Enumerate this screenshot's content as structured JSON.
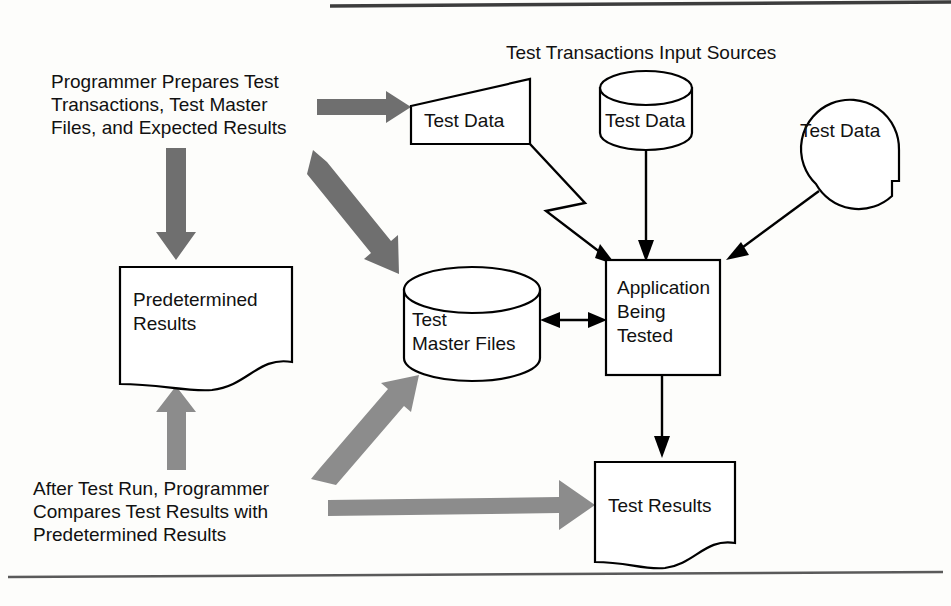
{
  "document": {
    "kind": "flowchart-diagram",
    "title": "Program testing data flow diagram"
  },
  "colors": {
    "page_background": "#fdfdfb",
    "line": "#000000",
    "text": "#111111",
    "gray_arrow_dark": "#6f6f6f",
    "gray_arrow_mid": "#8c8c8c",
    "page_rule": "#5a5a5a"
  },
  "headings": {
    "input_sources": "Test Transactions Input Sources"
  },
  "annotations": {
    "prepare": {
      "line1": "Programmer Prepares Test",
      "line2": "Transactions, Test Master",
      "line3": "Files, and Expected Results"
    },
    "compare": {
      "line1": "After Test Run, Programmer",
      "line2": "Compares Test Results with",
      "line3": "Predetermined Results"
    }
  },
  "nodes": [
    {
      "id": "test-data-manual",
      "shape": "manual-input-trapezoid",
      "label": "Test Data"
    },
    {
      "id": "test-data-disk",
      "shape": "database-cylinder",
      "label": "Test Data"
    },
    {
      "id": "test-data-tape",
      "shape": "magnetic-tape-circle",
      "label": "Test Data"
    },
    {
      "id": "predetermined-results",
      "shape": "document",
      "label_line1": "Predetermined",
      "label_line2": "Results"
    },
    {
      "id": "test-master-files",
      "shape": "database-cylinder",
      "label_line1": "Test",
      "label_line2": "Master Files"
    },
    {
      "id": "application-being-tested",
      "shape": "process-box",
      "label_line1": "Application",
      "label_line2": "Being",
      "label_line3": "Tested"
    },
    {
      "id": "test-results",
      "shape": "document",
      "label": "Test Results"
    }
  ],
  "connectors": [
    {
      "id": "prepare-to-manual",
      "style": "gray-block-arrow",
      "direction": "right"
    },
    {
      "id": "prepare-to-predetermined",
      "style": "gray-block-arrow",
      "direction": "down"
    },
    {
      "id": "prepare-to-master-files",
      "style": "gray-block-arrow",
      "direction": "down-right"
    },
    {
      "id": "manual-to-application",
      "style": "thin-zigzag-arrow"
    },
    {
      "id": "disk-to-application",
      "style": "thin-arrow",
      "direction": "down"
    },
    {
      "id": "tape-to-application",
      "style": "thin-arrow",
      "direction": "down-left"
    },
    {
      "id": "master-files-application",
      "style": "thin-double-arrow",
      "direction": "both"
    },
    {
      "id": "application-to-results",
      "style": "thin-arrow",
      "direction": "down"
    },
    {
      "id": "compare-to-predetermined",
      "style": "gray-block-arrow",
      "direction": "up"
    },
    {
      "id": "compare-to-master-files",
      "style": "gray-block-arrow",
      "direction": "up-right"
    },
    {
      "id": "compare-to-test-results",
      "style": "gray-block-arrow",
      "direction": "right"
    }
  ]
}
